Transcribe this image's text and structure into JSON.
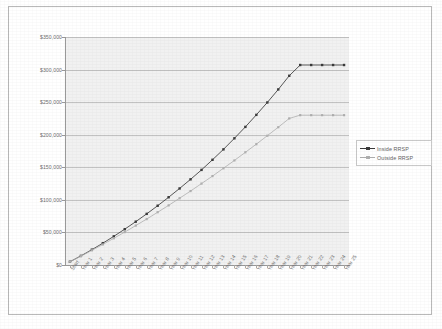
{
  "chart_data": {
    "type": "line",
    "title": "",
    "xlabel": "",
    "ylabel": "",
    "ylim": [
      0,
      350000
    ],
    "ytick_step": 50000,
    "grid": true,
    "legend_position": "right",
    "y_ticks": [
      "$0",
      "$50,000",
      "$100,000",
      "$150,000",
      "$200,000",
      "$250,000",
      "$300,000",
      "$350,000"
    ],
    "y_tick_values": [
      0,
      50000,
      100000,
      150000,
      200000,
      250000,
      300000,
      350000
    ],
    "categories": [
      "Start",
      "Year 1",
      "Year 2",
      "Year 3",
      "Year 4",
      "Year 5",
      "Year 6",
      "Year 7",
      "Year 8",
      "Year 9",
      "Year 10",
      "Year 11",
      "Year 12",
      "Year 13",
      "Year 14",
      "Year 15",
      "Year 16",
      "Year 17",
      "Year 18",
      "Year 19",
      "Year 20",
      "Year 21",
      "Year 22",
      "Year 23",
      "Year 24",
      "Year 25"
    ],
    "series": [
      {
        "name": "Inside RRSP",
        "color": "#3b3b3b",
        "marker": "square",
        "values": [
          5000,
          14000,
          23500,
          33500,
          44000,
          55000,
          66500,
          78500,
          91000,
          104000,
          117500,
          131500,
          146000,
          161500,
          177500,
          194500,
          212000,
          230500,
          249500,
          269500,
          290500,
          307000,
          307000,
          307000,
          307000,
          307000
        ]
      },
      {
        "name": "Outside RRSP",
        "color": "#b0b0b0",
        "marker": "square",
        "values": [
          5000,
          13500,
          22500,
          31500,
          41000,
          50500,
          60500,
          70500,
          81000,
          91500,
          102500,
          113500,
          125000,
          136500,
          148500,
          160500,
          173000,
          185500,
          198500,
          211500,
          225000,
          230000,
          230000,
          230000,
          230000,
          230000
        ]
      }
    ]
  },
  "legend": {
    "items": [
      {
        "label": "Inside RRSP",
        "color": "#3b3b3b"
      },
      {
        "label": "Outside RRSP",
        "color": "#b0b0b0"
      }
    ]
  },
  "colors": {
    "plot_background": "#f1f1f1",
    "gridline": "#c2c2c2",
    "axis": "#9a9a9a",
    "page_background": "#ffffff",
    "frame_border": "#b9b9b9",
    "series_inside": "#3b3b3b",
    "series_outside": "#b0b0b0",
    "tick_text": "#6d6d6d"
  }
}
